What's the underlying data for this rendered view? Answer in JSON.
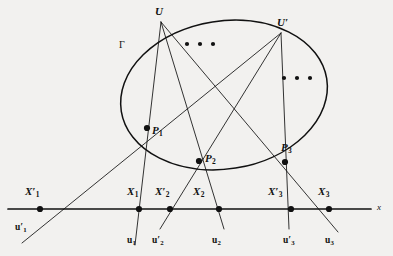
{
  "figure": {
    "type": "geometry-diagram",
    "caption_text": "",
    "background_color": "#f2f1ef",
    "stroke_color": "#111111",
    "conic": {
      "name": "Gamma",
      "label": "Γ",
      "label_pos": {
        "x": 119,
        "y": 40
      },
      "center": {
        "x": 224,
        "y": 95
      },
      "rx": 104,
      "ry": 74,
      "rotation_deg": -9
    },
    "axis": {
      "label": "x",
      "label_pos": {
        "x": 377,
        "y": 203
      },
      "y": 209,
      "x_start": 8,
      "x_end": 371
    },
    "vertices": [
      {
        "id": "U",
        "label": "U",
        "prime": false,
        "x": 161,
        "y": 22,
        "label_pos": {
          "x": 155,
          "y": 6
        }
      },
      {
        "id": "U'",
        "label": "U",
        "prime": true,
        "x": 281,
        "y": 33,
        "label_pos": {
          "x": 277,
          "y": 17
        }
      }
    ],
    "conic_points": [
      {
        "id": "P1",
        "label": "P",
        "sub": "1",
        "x": 147,
        "y": 128,
        "label_pos": {
          "x": 152,
          "y": 125
        }
      },
      {
        "id": "P2",
        "label": "P",
        "sub": "2",
        "x": 199,
        "y": 161,
        "label_pos": {
          "x": 205,
          "y": 153
        }
      },
      {
        "id": "P3",
        "label": "P",
        "sub": "3",
        "x": 285,
        "y": 162,
        "label_pos": {
          "x": 281,
          "y": 142
        }
      }
    ],
    "axis_points": [
      {
        "id": "X1p",
        "label": "X",
        "sub": "1",
        "prime": true,
        "x": 40,
        "y": 209,
        "label_pos": {
          "x": 25,
          "y": 186
        }
      },
      {
        "id": "X1",
        "label": "X",
        "sub": "1",
        "prime": false,
        "x": 139,
        "y": 209,
        "label_pos": {
          "x": 127,
          "y": 186
        }
      },
      {
        "id": "X2p",
        "label": "X",
        "sub": "2",
        "prime": true,
        "x": 170,
        "y": 209,
        "label_pos": {
          "x": 155,
          "y": 186
        }
      },
      {
        "id": "X2",
        "label": "X",
        "sub": "2",
        "prime": false,
        "x": 219,
        "y": 209,
        "label_pos": {
          "x": 193,
          "y": 186
        }
      },
      {
        "id": "X3p",
        "label": "X",
        "sub": "3",
        "prime": true,
        "x": 291,
        "y": 209,
        "label_pos": {
          "x": 268,
          "y": 186
        }
      },
      {
        "id": "X3",
        "label": "X",
        "sub": "3",
        "prime": false,
        "x": 329,
        "y": 209,
        "label_pos": {
          "x": 318,
          "y": 186
        }
      }
    ],
    "ray_labels": [
      {
        "id": "u1p",
        "label": "u",
        "sub": "1",
        "prime": true,
        "pos": {
          "x": 15,
          "y": 223
        }
      },
      {
        "id": "u1",
        "label": "u",
        "sub": "1",
        "prime": false,
        "pos": {
          "x": 127,
          "y": 236
        }
      },
      {
        "id": "u2p",
        "label": "u",
        "sub": "2",
        "prime": true,
        "pos": {
          "x": 152,
          "y": 236
        }
      },
      {
        "id": "u2",
        "label": "u",
        "sub": "2",
        "prime": false,
        "pos": {
          "x": 212,
          "y": 236
        }
      },
      {
        "id": "u3p",
        "label": "u",
        "sub": "3",
        "prime": true,
        "pos": {
          "x": 283,
          "y": 236
        }
      },
      {
        "id": "u3",
        "label": "u",
        "sub": "3",
        "prime": false,
        "pos": {
          "x": 325,
          "y": 236
        }
      }
    ],
    "lines": [
      {
        "id": "line-U-P1-X1",
        "from": "U",
        "through": "P1",
        "to": "X1",
        "ray_label": "u1"
      },
      {
        "id": "line-U-P2-X2",
        "from": "U",
        "through": "P2",
        "to": "X2",
        "ray_label": "u2"
      },
      {
        "id": "line-U-P3-X3",
        "from": "U",
        "through": "P3",
        "to": "X3",
        "ray_label": "u3"
      },
      {
        "id": "line-Up-P1-X1p",
        "from": "U'",
        "through": "P1",
        "to": "X1p",
        "ray_label": "u1p"
      },
      {
        "id": "line-Up-P2-X2p",
        "from": "U'",
        "through": "P2",
        "to": "X2p",
        "ray_label": "u2p"
      },
      {
        "id": "line-Up-P3-X3p",
        "from": "U'",
        "through": "P3",
        "to": "X3p",
        "ray_label": "u3p"
      }
    ],
    "ellipses_dots": [
      {
        "id": "dots-upper",
        "cx": 200,
        "cy": 44,
        "count": 3,
        "spacing": 13,
        "r": 2.1
      },
      {
        "id": "dots-lower",
        "cx": 297,
        "cy": 78,
        "count": 3,
        "spacing": 13,
        "r": 2.1
      }
    ]
  }
}
